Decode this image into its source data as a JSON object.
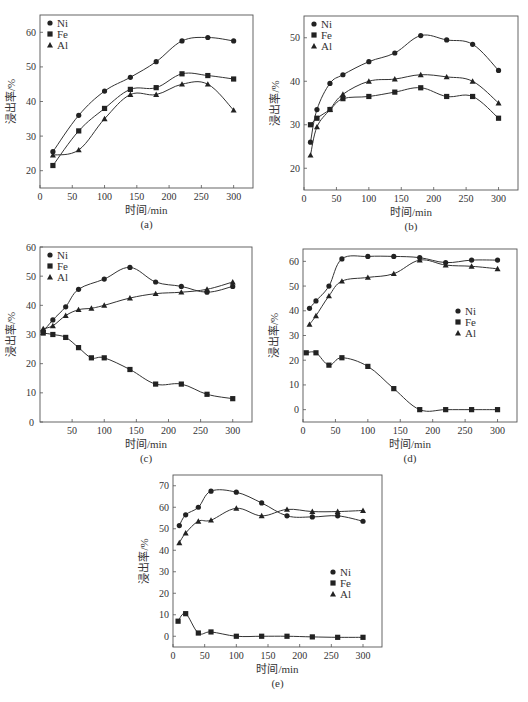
{
  "chart_data": [
    {
      "id": "a",
      "type": "line",
      "caption": "(a)",
      "xlabel": "时间/min",
      "ylabel": "浸出率/%",
      "xlim": [
        0,
        330
      ],
      "ylim": [
        15,
        65
      ],
      "xticks": [
        0,
        50,
        100,
        150,
        200,
        250,
        300
      ],
      "yticks": [
        20,
        30,
        40,
        50,
        60
      ],
      "legend": {
        "position": "top-left",
        "entries": [
          "Ni",
          "Fe",
          "Al"
        ]
      },
      "grid": false,
      "series": [
        {
          "name": "Ni",
          "marker": "circle",
          "x": [
            20,
            60,
            100,
            140,
            180,
            220,
            260,
            300
          ],
          "y": [
            25.5,
            36,
            43,
            47,
            51.5,
            57.5,
            58.5,
            57.5
          ]
        },
        {
          "name": "Fe",
          "marker": "square",
          "x": [
            20,
            60,
            100,
            140,
            180,
            220,
            260,
            300
          ],
          "y": [
            21.5,
            31.5,
            38,
            43.5,
            44,
            48,
            47.5,
            46.5
          ]
        },
        {
          "name": "Al",
          "marker": "triangle",
          "x": [
            20,
            60,
            100,
            140,
            180,
            220,
            260,
            300
          ],
          "y": [
            24.5,
            26,
            35,
            42,
            42,
            45,
            45,
            37.5
          ]
        }
      ]
    },
    {
      "id": "b",
      "type": "line",
      "caption": "(b)",
      "xlabel": "时间/min",
      "ylabel": "浸出率/%",
      "xlim": [
        0,
        330
      ],
      "ylim": [
        15,
        55
      ],
      "xticks": [
        0,
        50,
        100,
        150,
        200,
        250,
        300
      ],
      "yticks": [
        20,
        30,
        40,
        50
      ],
      "legend": {
        "position": "top-left",
        "entries": [
          "Ni",
          "Fe",
          "Al"
        ]
      },
      "grid": false,
      "series": [
        {
          "name": "Ni",
          "marker": "circle",
          "x": [
            10,
            20,
            40,
            60,
            100,
            140,
            180,
            220,
            260,
            300
          ],
          "y": [
            26,
            33.5,
            39.5,
            41.5,
            44.5,
            46.5,
            50.5,
            49.5,
            48.5,
            42.5
          ]
        },
        {
          "name": "Fe",
          "marker": "square",
          "x": [
            10,
            20,
            40,
            60,
            100,
            140,
            180,
            220,
            260,
            300
          ],
          "y": [
            30,
            31.5,
            33.5,
            36,
            36.5,
            37.5,
            38.5,
            36.5,
            36.5,
            31.5
          ]
        },
        {
          "name": "Al",
          "marker": "triangle",
          "x": [
            10,
            20,
            40,
            60,
            100,
            140,
            180,
            220,
            260,
            300
          ],
          "y": [
            23,
            29.5,
            33.5,
            37,
            40,
            40.5,
            41.5,
            41,
            40,
            35
          ]
        }
      ]
    },
    {
      "id": "c",
      "type": "line",
      "caption": "(c)",
      "xlabel": "时间/min",
      "ylabel": "浸出率/%",
      "xlim": [
        0,
        330
      ],
      "ylim": [
        0,
        60
      ],
      "xticks": [
        50,
        100,
        150,
        200,
        250,
        300
      ],
      "yticks": [
        0,
        10,
        20,
        30,
        40,
        50,
        60
      ],
      "legend": {
        "position": "top-left",
        "entries": [
          "Ni",
          "Fe",
          "Al"
        ]
      },
      "grid": false,
      "series": [
        {
          "name": "Ni",
          "marker": "circle",
          "x": [
            5,
            20,
            40,
            60,
            100,
            140,
            180,
            220,
            260,
            300
          ],
          "y": [
            31,
            35,
            39.5,
            45.5,
            49,
            53,
            48,
            46.5,
            44.5,
            46.5
          ]
        },
        {
          "name": "Fe",
          "marker": "square",
          "x": [
            5,
            20,
            40,
            60,
            80,
            100,
            140,
            180,
            220,
            260,
            300
          ],
          "y": [
            30.5,
            30,
            29,
            25.5,
            22,
            22,
            18,
            13,
            13,
            9.5,
            8
          ]
        },
        {
          "name": "Al",
          "marker": "triangle",
          "x": [
            5,
            20,
            40,
            60,
            80,
            100,
            140,
            180,
            220,
            260,
            300
          ],
          "y": [
            32,
            33,
            36.5,
            38.5,
            39,
            40,
            42.5,
            44,
            44.5,
            45.5,
            48
          ]
        }
      ]
    },
    {
      "id": "d",
      "type": "line",
      "caption": "(d)",
      "xlabel": "时间/min",
      "ylabel": "浸出率/%",
      "xlim": [
        0,
        330
      ],
      "ylim": [
        -5,
        65
      ],
      "xticks": [
        0,
        50,
        100,
        150,
        200,
        250,
        300
      ],
      "yticks": [
        0,
        10,
        20,
        30,
        40,
        50,
        60
      ],
      "legend": {
        "position": "middle-right",
        "entries": [
          "Ni",
          "Fe",
          "Al"
        ]
      },
      "grid": false,
      "series": [
        {
          "name": "Ni",
          "marker": "circle",
          "x": [
            10,
            20,
            40,
            60,
            100,
            140,
            180,
            220,
            260,
            300
          ],
          "y": [
            41,
            44,
            50,
            61,
            62,
            62,
            61.5,
            59.5,
            60.5,
            60.5
          ]
        },
        {
          "name": "Fe",
          "marker": "square",
          "x": [
            5,
            20,
            40,
            60,
            100,
            140,
            180,
            220,
            260,
            300
          ],
          "y": [
            23,
            23,
            18,
            21,
            17.5,
            8.5,
            0,
            0,
            0,
            0
          ]
        },
        {
          "name": "Al",
          "marker": "triangle",
          "x": [
            10,
            20,
            40,
            60,
            100,
            140,
            180,
            220,
            260,
            300
          ],
          "y": [
            34.5,
            38,
            46,
            52,
            53.5,
            55,
            60.5,
            58.5,
            58,
            57
          ]
        }
      ]
    },
    {
      "id": "e",
      "type": "line",
      "caption": "(e)",
      "xlabel": "时间/min",
      "ylabel": "浸出率/%",
      "xlim": [
        0,
        330
      ],
      "ylim": [
        -5,
        75
      ],
      "xticks": [
        0,
        50,
        100,
        150,
        200,
        250,
        300
      ],
      "yticks": [
        0,
        10,
        20,
        30,
        40,
        50,
        60,
        70
      ],
      "legend": {
        "position": "middle-right",
        "entries": [
          "Ni",
          "Fe",
          "Al"
        ]
      },
      "grid": false,
      "series": [
        {
          "name": "Ni",
          "marker": "circle",
          "x": [
            10,
            20,
            40,
            60,
            100,
            140,
            180,
            220,
            260,
            300
          ],
          "y": [
            51.5,
            56.5,
            60,
            67.5,
            67,
            62,
            56,
            55.5,
            56,
            53.5
          ]
        },
        {
          "name": "Fe",
          "marker": "square",
          "x": [
            8,
            20,
            40,
            60,
            100,
            140,
            180,
            220,
            260,
            300
          ],
          "y": [
            7,
            10.5,
            1.5,
            2,
            0,
            0,
            0,
            -0.3,
            -0.5,
            -0.5
          ]
        },
        {
          "name": "Al",
          "marker": "triangle",
          "x": [
            10,
            20,
            40,
            60,
            100,
            140,
            180,
            220,
            260,
            300
          ],
          "y": [
            43.5,
            48,
            53.5,
            54,
            59.5,
            56,
            59,
            58,
            58,
            58.5
          ]
        }
      ]
    }
  ],
  "layout": {
    "a": {
      "box": [
        40,
        15,
        253,
        188
      ]
    },
    "b": {
      "box": [
        304,
        16,
        518,
        190
      ]
    },
    "c": {
      "box": [
        40,
        247,
        252,
        422
      ]
    },
    "d": {
      "box": [
        303,
        249,
        517,
        422
      ]
    },
    "e": {
      "box": [
        173,
        475,
        382,
        647
      ]
    }
  },
  "colors": {
    "line": "#333333",
    "axis": "#555555"
  }
}
